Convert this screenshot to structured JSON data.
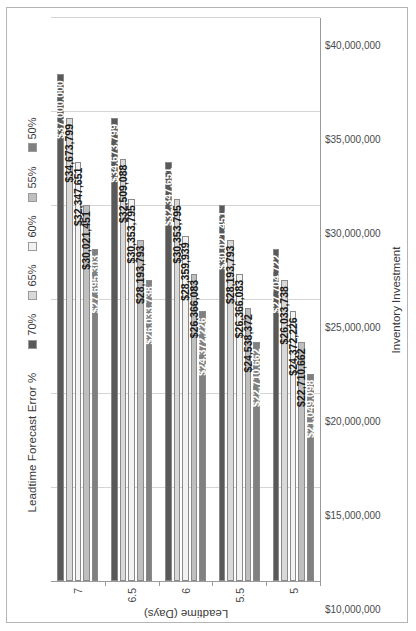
{
  "chart_data": {
    "type": "bar",
    "orientation": "horizontal",
    "title": "",
    "xlabel": "Leadtime (Days)",
    "ylabel": "Inventory Investment",
    "legend_title": "Leadtime Forecast Error %",
    "legend_position": "top",
    "grid": true,
    "categories": [
      "7",
      "6.5",
      "6",
      "5.5",
      "5"
    ],
    "value_axis_ticks": [
      "$10,000,000",
      "$15,000,000",
      "$20,000,000",
      "$25,000,000",
      "$30,000,000",
      "$35,000,000",
      "$40,000,000"
    ],
    "value_axis_tick_values": [
      10000000,
      15000000,
      20000000,
      25000000,
      30000000,
      35000000,
      40000000
    ],
    "ylim": [
      10000000,
      40000000
    ],
    "series": [
      {
        "name": "70%",
        "color": "#595959",
        "label_color": "light",
        "values": [
          37000000,
          34673799,
          32347651,
          30021451,
          27704722
        ],
        "labels": [
          "$37,000,000",
          "$34,673,799",
          "$32,347,651",
          "$30,021,451",
          "$27,704,722"
        ]
      },
      {
        "name": "65%",
        "color": "#d9d9d9",
        "label_color": "dark",
        "values": [
          34673799,
          32509088,
          30353795,
          28193793,
          26033738
        ],
        "labels": [
          "$34,673,799",
          "$32,509,088",
          "$30,353,795",
          "$28,193,793",
          "$26,033,738"
        ]
      },
      {
        "name": "60%",
        "color": "#f2f2f2",
        "label_color": "dark",
        "values": [
          32347651,
          30353795,
          28359939,
          26366083,
          24372226
        ],
        "labels": [
          "$32,347,651",
          "$30,353,795",
          "$28,359,939",
          "$26,366,083",
          "$24,372,226"
        ]
      },
      {
        "name": "55%",
        "color": "#bfbfbf",
        "label_color": "dark",
        "values": [
          30021451,
          28193793,
          26366083,
          24538372,
          22710662
        ],
        "labels": [
          "$30,021,451",
          "$28,193,793",
          "$26,366,083",
          "$24,538,372",
          "$22,710,662"
        ]
      },
      {
        "name": "50%",
        "color": "#808080",
        "label_color": "light",
        "values": [
          27695303,
          26033738,
          24372226,
          22710662,
          21049098
        ],
        "labels": [
          "$27,695,303",
          "$26,033,738",
          "$24,372,226",
          "$22,710,662",
          "$21,049,098"
        ]
      }
    ]
  },
  "legend": {
    "title": "Leadtime Forecast Error %",
    "items": [
      {
        "label": "70%",
        "color": "#595959"
      },
      {
        "label": "65%",
        "color": "#d9d9d9"
      },
      {
        "label": "60%",
        "color": "#f2f2f2"
      },
      {
        "label": "55%",
        "color": "#bfbfbf"
      },
      {
        "label": "50%",
        "color": "#808080"
      }
    ]
  },
  "axes": {
    "x_title": "Leadtime (Days)",
    "y_title": "Inventory Investment"
  }
}
